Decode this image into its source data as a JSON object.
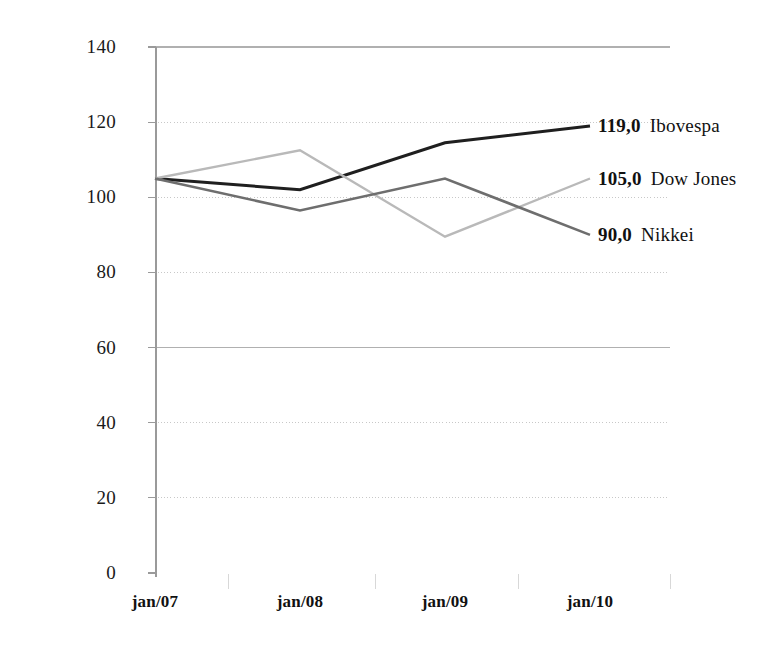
{
  "chart_data": {
    "type": "line",
    "title": "",
    "subtitle": "",
    "xlabel": "",
    "ylabel": "",
    "categories": [
      "jan/07",
      "jan/08",
      "jan/09",
      "jan/10"
    ],
    "ylim": [
      0,
      140
    ],
    "yticks": [
      "0",
      "20",
      "40",
      "60",
      "80",
      "100",
      "120",
      "140"
    ],
    "ytick_values": [
      0,
      20,
      40,
      60,
      80,
      100,
      120,
      140
    ],
    "grid": true,
    "grid_style": "dotted",
    "legend_position": "right-inline-end-of-line",
    "series": [
      {
        "name": "Ibovespa",
        "values": [
          105,
          102,
          114.5,
          119
        ],
        "end_label": "119,0",
        "color": "#1f1f1f",
        "line_width": 3.0
      },
      {
        "name": "Dow Jones",
        "values": [
          105,
          112.5,
          89.5,
          105
        ],
        "end_label": "105,0",
        "color": "#b9b9b9",
        "line_width": 2.4
      },
      {
        "name": "Nikkei",
        "values": [
          105,
          96.5,
          105,
          90
        ],
        "end_label": "90,0",
        "color": "#6e6e6e",
        "line_width": 2.6
      }
    ]
  },
  "annotations": [
    {
      "value": "119,0",
      "name": "Ibovespa"
    },
    {
      "value": "105,0",
      "name": "Dow Jones"
    },
    {
      "value": "90,0",
      "name": "Nikkei"
    }
  ],
  "colors": {
    "axis": "#9a9a9a",
    "grid": "#c8c8c8",
    "grid_strong": "#b0b0b0",
    "text": "#111111",
    "background": "#ffffff",
    "series_dark": "#1f1f1f",
    "series_mid": "#6e6e6e",
    "series_light": "#b9b9b9"
  }
}
